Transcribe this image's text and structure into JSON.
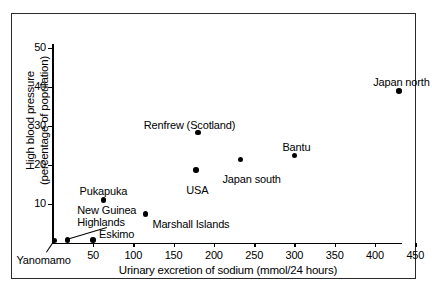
{
  "chart_data": {
    "type": "scatter",
    "title": "",
    "xlabel": "Urinary excretion of sodium (mmol/24 hours)",
    "ylabel": "High blood pressure (percentage of population)",
    "ylabel_line1": "High blood pressure",
    "ylabel_line2": "(percentage of population)",
    "xlim": [
      0,
      460
    ],
    "ylim": [
      0,
      52
    ],
    "xticks": [
      50,
      100,
      150,
      200,
      250,
      300,
      350,
      400,
      450
    ],
    "yticks": [
      10,
      20,
      30,
      40,
      50
    ],
    "grid": false,
    "legend": "none",
    "points": [
      {
        "label": "Yanomamo",
        "x": 2,
        "y": 0.7,
        "label_dx": -38,
        "label_dy": 14,
        "leader": true
      },
      {
        "label": "New Guinea\nHighlands",
        "x": 18,
        "y": 0.8,
        "label_dx": 10,
        "label_dy": -36,
        "leader": true
      },
      {
        "label": "Eskimo",
        "x": 50,
        "y": 0.8,
        "label_dx": 6,
        "label_dy": -12,
        "leader": false
      },
      {
        "label": "Pukapuka",
        "x": 63,
        "y": 11.0,
        "label_dx": -24,
        "label_dy": -15,
        "leader": false
      },
      {
        "label": "Marshall Islands",
        "x": 115,
        "y": 7.5,
        "label_dx": 7,
        "label_dy": 4,
        "leader": false
      },
      {
        "label": "USA",
        "x": 178,
        "y": 18.7,
        "label_dx": -10,
        "label_dy": 14,
        "leader": false
      },
      {
        "label": "Renfrew (Scotland)",
        "x": 180,
        "y": 28.3,
        "label_dx": -54,
        "label_dy": -14,
        "leader": false
      },
      {
        "label": "Japan south",
        "x": 233,
        "y": 21.4,
        "label_dx": -18,
        "label_dy": 13,
        "leader": false
      },
      {
        "label": "Bantu",
        "x": 300,
        "y": 22.4,
        "label_dx": -12,
        "label_dy": -15,
        "leader": false
      },
      {
        "label": "Japan north",
        "x": 430,
        "y": 39.0,
        "label_dx": -26,
        "label_dy": -15,
        "leader": false
      }
    ],
    "ylabel_ticks_text": [
      "10",
      "20",
      "30",
      "40",
      "50"
    ],
    "xlabel_ticks_text": [
      "50",
      "100",
      "150",
      "200",
      "250",
      "300",
      "350",
      "400",
      "450"
    ],
    "marker_color": "#000000",
    "axis_color": "#000000",
    "frame_color": "#2a2a2a",
    "background": "#ffffff"
  }
}
